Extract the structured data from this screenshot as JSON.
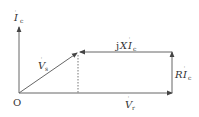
{
  "diagram": {
    "type": "phasor-diagram",
    "colors": {
      "line": "#555555",
      "text": "#333333",
      "background": "#ffffff"
    },
    "origin": {
      "label": "O",
      "x": 19,
      "y": 93
    },
    "axis_current": {
      "symbol": "I",
      "subscript": "c",
      "dot": true
    },
    "vectors": {
      "Vs": {
        "symbol": "V",
        "subscript": "s",
        "dot": true,
        "from": [
          19,
          93
        ],
        "to": [
          78,
          52
        ]
      },
      "Vr": {
        "symbol": "V",
        "subscript": "r",
        "dot": true,
        "from": [
          19,
          93
        ],
        "to": [
          172,
          93
        ]
      },
      "RIc": {
        "prefix": "R",
        "symbol": "I",
        "subscript": "c",
        "dot": true,
        "from": [
          172,
          93
        ],
        "to": [
          172,
          52
        ]
      },
      "jXIc": {
        "prefix": "jX",
        "symbol": "I",
        "subscript": "c",
        "dot": true,
        "from": [
          172,
          52
        ],
        "to": [
          78,
          52
        ]
      }
    },
    "projection": {
      "style": "dashed",
      "from": [
        78,
        54
      ],
      "to": [
        78,
        93
      ]
    }
  }
}
